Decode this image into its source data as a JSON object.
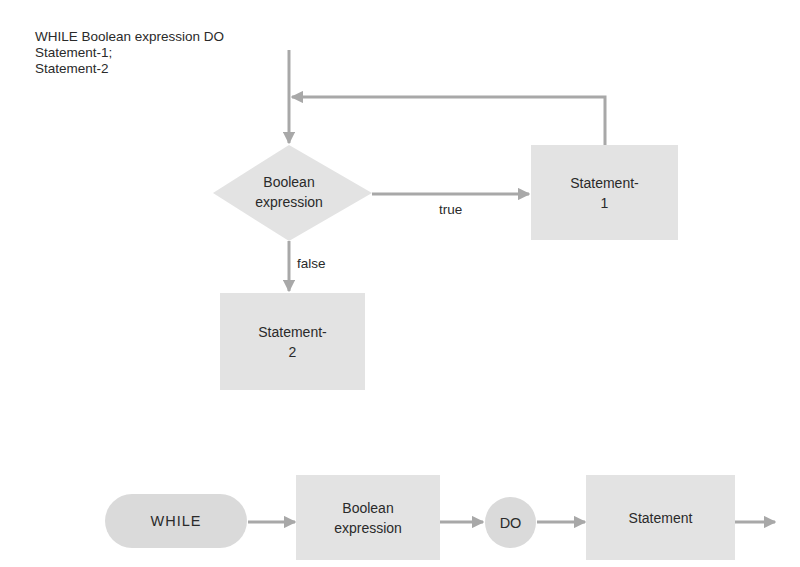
{
  "code": {
    "lines": [
      "WHILE Boolean expression DO",
      "Statement-1;",
      "Statement-2"
    ]
  },
  "flowchart": {
    "decision": {
      "line1": "Boolean",
      "line2": "expression"
    },
    "true_label": "true",
    "false_label": "false",
    "statement1": {
      "line1": "Statement-",
      "line2": "1"
    },
    "statement2": {
      "line1": "Statement-",
      "line2": "2"
    }
  },
  "syntax_diagram": {
    "while_keyword": "WHILE",
    "condition": {
      "line1": "Boolean",
      "line2": "expression"
    },
    "do_keyword": "DO",
    "statement": "Statement"
  },
  "colors": {
    "shape_fill": "#e3e3e3",
    "terminal_fill": "#dadada",
    "connector": "#a8a8a8",
    "text": "#2a2a2a"
  }
}
